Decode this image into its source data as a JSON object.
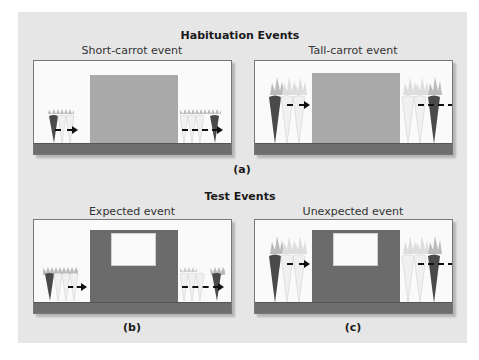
{
  "habituation": {
    "title": "Habituation Events",
    "label": "(a)",
    "panels": [
      {
        "title": "Short-carrot event",
        "carrot_size": "short",
        "screen": "plain"
      },
      {
        "title": "Tall-carrot event",
        "carrot_size": "tall",
        "screen": "plain"
      }
    ]
  },
  "test": {
    "title": "Test Events",
    "panels": [
      {
        "title": "Expected event",
        "label": "(b)",
        "carrot_size": "short",
        "screen": "windowed"
      },
      {
        "title": "Unexpected event",
        "label": "(c)",
        "carrot_size": "tall",
        "screen": "windowed"
      }
    ]
  },
  "colors": {
    "background": "#e6e6e6",
    "stage": "#fafafa",
    "ground": "#6e6e6e",
    "plain_screen": "#a9a9a9",
    "windowed_screen": "#6b6b6b",
    "dark_carrot": "#4a4a4a",
    "light_carrot": "#f0f0f0"
  },
  "icons": [
    "carrot-icon",
    "dashed-arrow-icon"
  ]
}
